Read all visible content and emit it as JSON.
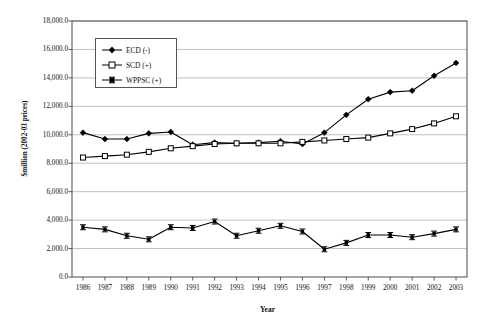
{
  "chart_data": {
    "type": "line",
    "title": "",
    "xlabel": "Year",
    "ylabel": "$million (2002-03 prices)",
    "categories": [
      "1986",
      "1987",
      "1988",
      "1989",
      "1990",
      "1991",
      "1992",
      "1993",
      "1994",
      "1995",
      "1996",
      "1997",
      "1998",
      "1999",
      "2000",
      "2001",
      "2002",
      "2003"
    ],
    "ylim": [
      0,
      18000
    ],
    "ytick_labels": [
      "0.0",
      "2,000.0",
      "4,000.0",
      "6,000.0",
      "8,000.0",
      "10,000.0",
      "12,000.0",
      "14,000.0",
      "16,000.0",
      "18,000.0"
    ],
    "ytick_values": [
      0,
      2000,
      4000,
      6000,
      8000,
      10000,
      12000,
      14000,
      16000,
      18000
    ],
    "grid": true,
    "legend_position": "upper-left-inside",
    "series": [
      {
        "name": "ECD (-)",
        "marker": "filled-diamond",
        "color": "#000000",
        "values": [
          10150,
          9700,
          9700,
          10100,
          10200,
          9300,
          9450,
          9400,
          9450,
          9550,
          9350,
          10150,
          11400,
          12500,
          13000,
          13100,
          14150,
          15050
        ]
      },
      {
        "name": "SCD (+)",
        "marker": "open-square",
        "color": "#000000",
        "values": [
          8400,
          8500,
          8600,
          8800,
          9050,
          9200,
          9350,
          9400,
          9400,
          9400,
          9500,
          9600,
          9700,
          9800,
          10100,
          10400,
          10800,
          11300
        ]
      },
      {
        "name": "WPPSC (+)",
        "marker": "filled-square-dash",
        "color": "#000000",
        "values": [
          3500,
          3350,
          2900,
          2650,
          3500,
          3450,
          3900,
          2900,
          3250,
          3600,
          3200,
          1950,
          2400,
          2950,
          2950,
          2800,
          3050,
          3350
        ]
      }
    ]
  },
  "legend": {
    "items": [
      {
        "label": "ECD (-)"
      },
      {
        "label": "SCD (+)"
      },
      {
        "label": "WPPSC (+)"
      }
    ]
  },
  "axes": {
    "x_title": "Year",
    "y_title": "$million (2002-03 prices)"
  }
}
